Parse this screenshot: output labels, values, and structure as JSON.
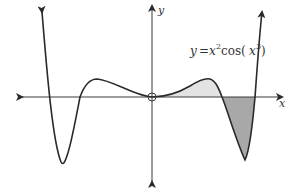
{
  "figure": {
    "function_label": {
      "y": "y",
      "equals": "=",
      "x": "x",
      "exp2": "2",
      "cos": "cos(",
      "x_inner": "x",
      "exp3": "3",
      "close": ")"
    },
    "axis_labels": {
      "x": "x",
      "y": "y"
    },
    "colors": {
      "curve": "#2a2a2a",
      "axis": "#3a3a3a",
      "shade_light": "#e3e3e3",
      "shade_dark": "#a8a8a8",
      "background": "#ffffff"
    }
  }
}
